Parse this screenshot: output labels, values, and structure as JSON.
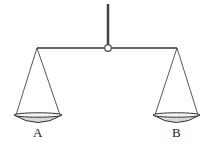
{
  "diagram": {
    "pans": [
      {
        "label": "A"
      },
      {
        "label": "B"
      }
    ],
    "colors": {
      "line": "#333333",
      "beam": "#555555",
      "pan_fill": "#d9d9d9",
      "background": "#ffffff"
    }
  }
}
